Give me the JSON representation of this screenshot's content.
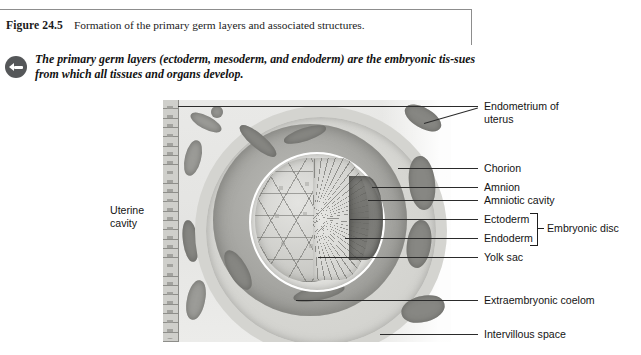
{
  "figure": {
    "number": "Figure 24.5",
    "caption": "Formation of the primary germ layers and associated structures.",
    "keypoint_icon": "arrow-bullet-icon",
    "keypoint": "The primary germ layers (ectoderm, mesoderm, and endoderm) are the embryonic tis-sues from which all tissues and organs develop."
  },
  "labels": {
    "left": [
      {
        "name": "uterine-cavity",
        "text": "Uterine\ncavity",
        "line1": "Uterine",
        "line2": "cavity"
      }
    ],
    "right": [
      {
        "name": "endometrium-of-uterus",
        "line1": "Endometrium of",
        "line2": "uterus"
      },
      {
        "name": "chorion",
        "line1": "Chorion"
      },
      {
        "name": "amnion",
        "line1": "Amnion"
      },
      {
        "name": "amniotic-cavity",
        "line1": "Amniotic cavity"
      },
      {
        "name": "ectoderm",
        "line1": "Ectoderm"
      },
      {
        "name": "endoderm",
        "line1": "Endoderm"
      },
      {
        "name": "yolk-sac",
        "line1": "Yolk sac"
      },
      {
        "name": "extraembryonic-coelom",
        "line1": "Extraembryonic coelom"
      },
      {
        "name": "intervillous-space",
        "line1": "Intervillous space"
      }
    ],
    "bracket": {
      "name": "embryonic-disc",
      "text": "Embryonic disc"
    }
  },
  "colors": {
    "frame_rule": "#8d8d8d",
    "leader_line": "#2b2b2b",
    "icon_fill": "#555759",
    "text": "#141414",
    "illustration_bg": "#e8e8e6",
    "amniotic_cavity": "#6e6e6a"
  }
}
